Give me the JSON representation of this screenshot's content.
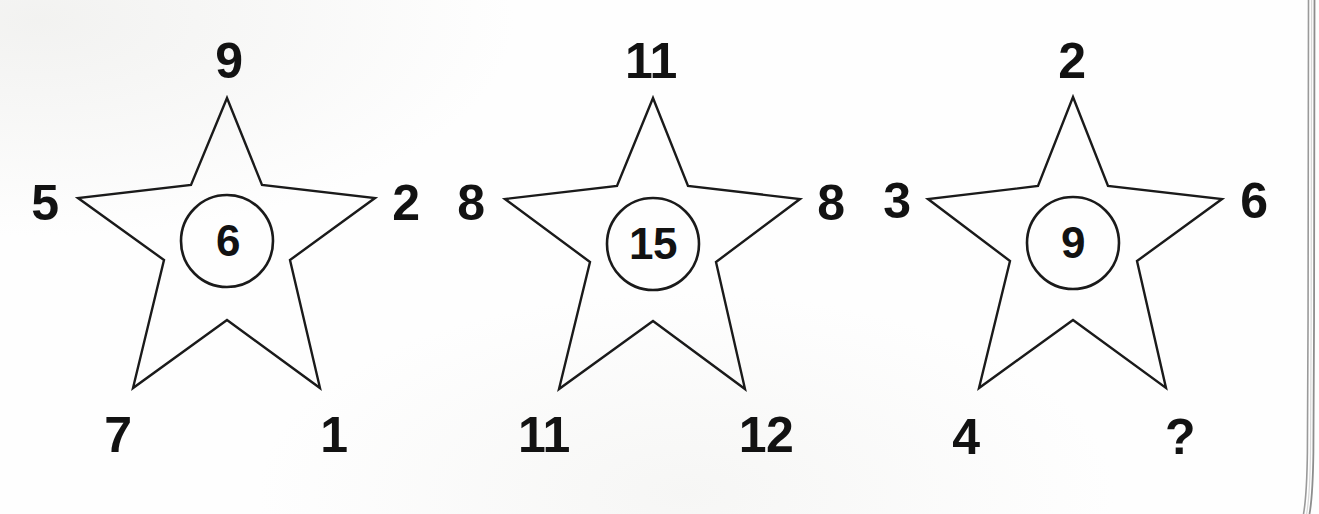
{
  "figure": {
    "type": "puzzle-diagram",
    "background_color": "#ffffff",
    "ink_color": "#121212",
    "stars": [
      {
        "id": "star-1",
        "center_value": "6",
        "points": {
          "top": "9",
          "left": "5",
          "right": "2",
          "bottom_left": "7",
          "bottom_right": "1"
        }
      },
      {
        "id": "star-2",
        "center_value": "15",
        "points": {
          "top": "11",
          "left": "8",
          "right": "8",
          "bottom_left": "11",
          "bottom_right": "12"
        }
      },
      {
        "id": "star-3",
        "center_value": "9",
        "points": {
          "top": "2",
          "left": "3",
          "right": "6",
          "bottom_left": "4",
          "bottom_right": "?"
        }
      }
    ]
  }
}
